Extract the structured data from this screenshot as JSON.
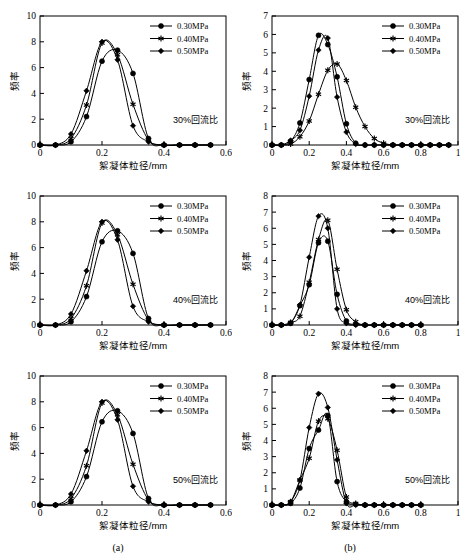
{
  "figure": {
    "subcaptions": [
      {
        "label": "(a)",
        "x": 118,
        "y": 551
      },
      {
        "label": "(b)",
        "x": 350,
        "y": 551
      }
    ]
  },
  "legend": {
    "entries": [
      {
        "label": "0.30MPa",
        "marker": "circle"
      },
      {
        "label": "0.40MPa",
        "marker": "star"
      },
      {
        "label": "0.50MPa",
        "marker": "diamond"
      }
    ]
  },
  "axis_labels": {
    "x": "絮凝体粒径/mm",
    "y": "频率"
  },
  "chart_data": [
    {
      "id": "panel-a-30",
      "type": "line",
      "title": "",
      "annotation": "30%回流比",
      "xlabel": "絮凝体粒径/mm",
      "ylabel": "频率",
      "xlim": [
        0,
        0.6
      ],
      "ylim": [
        0,
        10
      ],
      "xticks": [
        0,
        0.2,
        0.4,
        0.6
      ],
      "xticklabels": [
        "0",
        "0.2",
        "0.4",
        "0.6"
      ],
      "yticks": [
        0,
        2,
        4,
        6,
        8,
        10
      ],
      "yticklabels": [
        "0",
        "2",
        "4",
        "6",
        "8",
        "10"
      ],
      "grid": false,
      "legend_position": "top-right",
      "x": [
        0,
        0.05,
        0.1,
        0.15,
        0.2,
        0.25,
        0.3,
        0.35,
        0.4,
        0.45,
        0.5,
        0.55
      ],
      "series": [
        {
          "name": "0.30MPa",
          "marker": "circle",
          "values": [
            0,
            0,
            0.25,
            2.2,
            6.5,
            7.35,
            5.55,
            0.5,
            0,
            0,
            0,
            0
          ]
        },
        {
          "name": "0.40MPa",
          "marker": "star",
          "values": [
            0,
            0,
            0.5,
            3.1,
            7.9,
            7.0,
            3.15,
            0.4,
            0,
            0,
            0,
            0
          ]
        },
        {
          "name": "0.50MPa",
          "marker": "diamond",
          "values": [
            0,
            0,
            0.85,
            4.2,
            8.0,
            6.6,
            1.5,
            0.25,
            0,
            0,
            0,
            0
          ]
        }
      ]
    },
    {
      "id": "panel-b-30",
      "type": "line",
      "title": "",
      "annotation": "30%回流比",
      "xlabel": "絮凝体粒径/mm",
      "ylabel": "频率",
      "xlim": [
        0,
        1
      ],
      "ylim": [
        0,
        7
      ],
      "xticks": [
        0,
        0.2,
        0.4,
        0.6,
        0.8,
        1
      ],
      "xticklabels": [
        "0",
        "0.2",
        "0.4",
        "0.6",
        "0.8",
        "1"
      ],
      "yticks": [
        0,
        1,
        2,
        3,
        4,
        5,
        6,
        7
      ],
      "yticklabels": [
        "0",
        "1",
        "2",
        "3",
        "4",
        "5",
        "6",
        "7"
      ],
      "grid": false,
      "legend_position": "top-right",
      "x": [
        0,
        0.05,
        0.1,
        0.15,
        0.2,
        0.25,
        0.3,
        0.35,
        0.4,
        0.45,
        0.5,
        0.55,
        0.6,
        0.65,
        0.7,
        0.75,
        0.8,
        0.85,
        0.9,
        0.95
      ],
      "series": [
        {
          "name": "0.30MPa",
          "marker": "circle",
          "values": [
            0,
            0,
            0.2,
            1.2,
            3.55,
            5.95,
            5.45,
            3.7,
            1.15,
            0.1,
            0,
            0,
            0,
            0,
            0,
            0,
            0,
            0,
            0,
            0
          ]
        },
        {
          "name": "0.40MPa",
          "marker": "star",
          "values": [
            0,
            0,
            0.05,
            0.45,
            1.3,
            2.75,
            4.05,
            4.4,
            3.5,
            2.05,
            1.0,
            0.35,
            0.1,
            0,
            0,
            0,
            0,
            0,
            0,
            0
          ]
        },
        {
          "name": "0.50MPa",
          "marker": "diamond",
          "values": [
            0,
            0,
            0.25,
            0.8,
            2.65,
            5.15,
            5.8,
            2.6,
            0.7,
            0.05,
            0,
            0,
            0,
            0,
            0,
            0,
            0,
            0,
            0,
            0
          ]
        }
      ]
    },
    {
      "id": "panel-a-40",
      "type": "line",
      "title": "",
      "annotation": "40%回流比",
      "xlabel": "絮凝体粒径/mm",
      "ylabel": "频率",
      "xlim": [
        0,
        0.6
      ],
      "ylim": [
        0,
        10
      ],
      "xticks": [
        0,
        0.2,
        0.4,
        0.6
      ],
      "xticklabels": [
        "0",
        "0.2",
        "0.4",
        "0.6"
      ],
      "yticks": [
        0,
        2,
        4,
        6,
        8,
        10
      ],
      "yticklabels": [
        "0",
        "2",
        "4",
        "6",
        "8",
        "10"
      ],
      "grid": false,
      "legend_position": "top-right",
      "x": [
        0,
        0.05,
        0.1,
        0.15,
        0.2,
        0.25,
        0.3,
        0.35,
        0.4,
        0.45,
        0.5,
        0.55
      ],
      "series": [
        {
          "name": "0.30MPa",
          "marker": "circle",
          "values": [
            0,
            0,
            0.25,
            2.2,
            6.45,
            7.3,
            5.55,
            0.5,
            0,
            0,
            0,
            0
          ]
        },
        {
          "name": "0.40MPa",
          "marker": "star",
          "values": [
            0,
            0,
            0.5,
            3.05,
            7.9,
            7.0,
            3.15,
            0.4,
            0,
            0,
            0,
            0
          ]
        },
        {
          "name": "0.50MPa",
          "marker": "diamond",
          "values": [
            0,
            0,
            0.85,
            4.2,
            8.0,
            6.6,
            1.45,
            0.25,
            0,
            0,
            0,
            0
          ]
        }
      ]
    },
    {
      "id": "panel-b-40",
      "type": "line",
      "title": "",
      "annotation": "40%回流比",
      "xlabel": "絮凝体粒径/mm",
      "ylabel": "频率",
      "xlim": [
        0,
        1
      ],
      "ylim": [
        0,
        8
      ],
      "xticks": [
        0,
        0.2,
        0.4,
        0.6,
        0.8,
        1
      ],
      "xticklabels": [
        "0",
        "0.2",
        "0.4",
        "0.6",
        "0.8",
        "1"
      ],
      "yticks": [
        0,
        1,
        2,
        3,
        4,
        5,
        6,
        7,
        8
      ],
      "yticklabels": [
        "0",
        "1",
        "2",
        "3",
        "4",
        "5",
        "6",
        "7",
        "8"
      ],
      "grid": false,
      "legend_position": "top-right",
      "x": [
        0,
        0.05,
        0.1,
        0.15,
        0.2,
        0.25,
        0.3,
        0.35,
        0.4,
        0.45,
        0.5,
        0.55,
        0.6,
        0.65,
        0.7,
        0.75,
        0.8
      ],
      "series": [
        {
          "name": "0.30MPa",
          "marker": "circle",
          "values": [
            0,
            0,
            0.1,
            1.2,
            2.5,
            5.1,
            5.2,
            1.9,
            0.25,
            0.05,
            0,
            0,
            0,
            0,
            0,
            0,
            0
          ]
        },
        {
          "name": "0.40MPa",
          "marker": "star",
          "values": [
            0,
            0,
            0.15,
            0.55,
            2.65,
            5.3,
            6.5,
            3.45,
            0.95,
            0.2,
            0,
            0,
            0,
            0,
            0,
            0,
            0
          ]
        },
        {
          "name": "0.50MPa",
          "marker": "diamond",
          "values": [
            0,
            0,
            0.15,
            1.25,
            4.2,
            6.75,
            6.0,
            1.0,
            0.1,
            0,
            0,
            0,
            0,
            0,
            0,
            0,
            0
          ]
        }
      ]
    },
    {
      "id": "panel-a-50",
      "type": "line",
      "title": "",
      "annotation": "50%回流比",
      "xlabel": "絮凝体粒径/mm",
      "ylabel": "频率",
      "xlim": [
        0,
        0.6
      ],
      "ylim": [
        0,
        10
      ],
      "xticks": [
        0,
        0.2,
        0.4,
        0.6
      ],
      "xticklabels": [
        "0",
        "0.2",
        "0.4",
        "0.6"
      ],
      "yticks": [
        0,
        2,
        4,
        6,
        8,
        10
      ],
      "yticklabels": [
        "0",
        "2",
        "4",
        "6",
        "8",
        "10"
      ],
      "grid": false,
      "legend_position": "top-right",
      "x": [
        0,
        0.05,
        0.1,
        0.15,
        0.2,
        0.25,
        0.3,
        0.35,
        0.4,
        0.45,
        0.5,
        0.55
      ],
      "series": [
        {
          "name": "0.30MPa",
          "marker": "circle",
          "values": [
            0,
            0,
            0.25,
            2.2,
            6.45,
            7.3,
            5.55,
            0.5,
            0,
            0,
            0,
            0
          ]
        },
        {
          "name": "0.40MPa",
          "marker": "star",
          "values": [
            0,
            0,
            0.5,
            3.05,
            7.9,
            7.0,
            3.15,
            0.4,
            0,
            0,
            0,
            0
          ]
        },
        {
          "name": "0.50MPa",
          "marker": "diamond",
          "values": [
            0,
            0,
            0.85,
            4.2,
            8.0,
            6.6,
            1.45,
            0.25,
            0,
            0,
            0,
            0
          ]
        }
      ]
    },
    {
      "id": "panel-b-50",
      "type": "line",
      "title": "",
      "annotation": "50%回流比",
      "xlabel": "絮凝体粒径/mm",
      "ylabel": "频率",
      "xlim": [
        0,
        1
      ],
      "ylim": [
        0,
        8
      ],
      "xticks": [
        0,
        0.2,
        0.4,
        0.6,
        0.8,
        1
      ],
      "xticklabels": [
        "0",
        "0.2",
        "0.4",
        "0.6",
        "0.8",
        "1"
      ],
      "yticks": [
        0,
        1,
        2,
        3,
        4,
        5,
        6,
        7,
        8
      ],
      "yticklabels": [
        "0",
        "1",
        "2",
        "3",
        "4",
        "5",
        "6",
        "7",
        "8"
      ],
      "grid": false,
      "legend_position": "top-right",
      "x": [
        0,
        0.05,
        0.1,
        0.15,
        0.2,
        0.25,
        0.3,
        0.35,
        0.4,
        0.45,
        0.5,
        0.55,
        0.6,
        0.65,
        0.7,
        0.75,
        0.8
      ],
      "series": [
        {
          "name": "0.30MPa",
          "marker": "circle",
          "values": [
            0,
            0,
            0.1,
            1.05,
            3.5,
            4.65,
            5.55,
            1.45,
            0.2,
            0.05,
            0,
            0,
            0,
            0,
            0,
            0,
            0
          ]
        },
        {
          "name": "0.40MPa",
          "marker": "star",
          "values": [
            0,
            0,
            0.2,
            1.55,
            2.9,
            5.2,
            5.35,
            3.4,
            0.5,
            0.1,
            0,
            0,
            0,
            0,
            0,
            0,
            0
          ]
        },
        {
          "name": "0.50MPa",
          "marker": "diamond",
          "values": [
            0,
            0,
            0.2,
            1.55,
            4.8,
            6.9,
            6.05,
            2.8,
            0.1,
            0,
            0,
            0,
            0,
            0,
            0,
            0,
            0
          ]
        }
      ]
    }
  ]
}
